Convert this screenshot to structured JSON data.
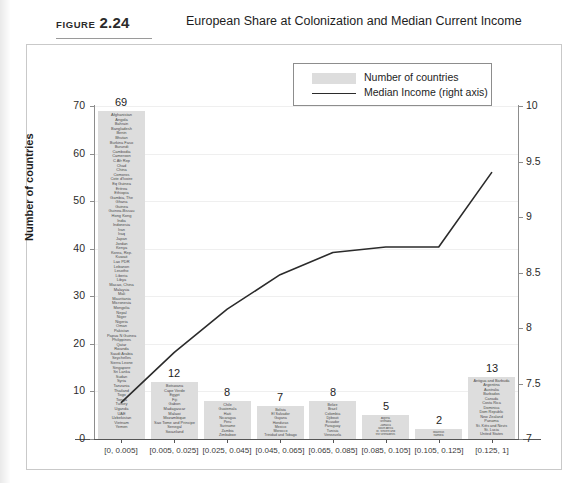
{
  "figure": {
    "label_word": "FIGURE",
    "label_number": "2.24",
    "title": "European Share at Colonization and Median Current Income"
  },
  "legend": {
    "items": [
      {
        "name": "bars",
        "label": "Number of countries",
        "marker": "grey-swatch",
        "color": "#dddddd"
      },
      {
        "name": "line",
        "label": "Median Income (right axis)",
        "marker": "black-line",
        "color": "#2b2b2b"
      }
    ]
  },
  "axes": {
    "left": {
      "title": "Number of countries",
      "ticks": [
        "0",
        "10",
        "20",
        "30",
        "40",
        "50",
        "60",
        "70"
      ],
      "min": 0,
      "max": 70
    },
    "right": {
      "title": "Median Current Income (in logs)",
      "ticks": [
        "7",
        "7.5",
        "8",
        "8.5",
        "9",
        "9.5",
        "10"
      ],
      "min": 7,
      "max": 10
    },
    "bottom": {
      "title": "",
      "ticks": [
        "[0, 0.005]",
        "[0.005, 0.025]",
        "[0.025, 0.045]",
        "[0.045, 0.065]",
        "[0.065, 0.085]",
        "[0.085, 0.105]",
        "[0.105, 0.125]",
        "[0.125, 1]"
      ]
    }
  },
  "chart_data": {
    "type": "bar",
    "title": "European Share at Colonization and Median Current Income",
    "xlabel": "",
    "ylabel": "Number of countries",
    "ylabel_secondary": "Median Current Income (in logs)",
    "ylim": [
      0,
      70
    ],
    "ylim_secondary": [
      7,
      10
    ],
    "grid": true,
    "legend_position": "top-center",
    "categories": [
      "[0, 0.005]",
      "[0.005, 0.025]",
      "[0.025, 0.045]",
      "[0.045, 0.065]",
      "[0.065, 0.085]",
      "[0.085, 0.105]",
      "[0.105, 0.125]",
      "[0.125, 1]"
    ],
    "series": [
      {
        "name": "Number of countries",
        "type": "bar",
        "axis": "left",
        "values": [
          69,
          12,
          8,
          7,
          8,
          5,
          2,
          13
        ]
      },
      {
        "name": "Median Income (right axis)",
        "type": "line",
        "axis": "right",
        "values": [
          7.33,
          7.78,
          8.17,
          8.48,
          8.68,
          8.73,
          8.73,
          9.4
        ]
      }
    ],
    "bin_members": [
      [
        "Afghanistan",
        "Angola",
        "Bahrain",
        "Bangladesh",
        "Benin",
        "Bhutan",
        "Burkina Faso",
        "Burundi",
        "Cambodia",
        "Cameroon",
        "C Afr Rep",
        "Chad",
        "China",
        "Comoros",
        "Cote d'Ivoire",
        "Eq Guinea",
        "Eritrea",
        "Ethiopia",
        "Gambia, The",
        "Ghana",
        "Guinea",
        "Guinea-Bissau",
        "Hong Kong",
        "India",
        "Indonesia",
        "Iran",
        "Iraq",
        "Japan",
        "Jordan",
        "Kenya",
        "Korea, Rep.",
        "Kuwait",
        "Lao PDR",
        "Lebanon",
        "Lesotho",
        "Liberia",
        "Libya",
        "Macao, China",
        "Malaysia",
        "Mali",
        "Mauritania",
        "Micronesia",
        "Mongolia",
        "Nepal",
        "Niger",
        "Nigeria",
        "Oman",
        "Pakistan",
        "Papua N Guinea",
        "Philippines",
        "Qatar",
        "Rwanda",
        "Saudi Arabia",
        "Seychelles",
        "Sierra Leone",
        "Singapore",
        "Sri Lanka",
        "Sudan",
        "Syria",
        "Tanzania",
        "Thailand",
        "Togo",
        "Tonga",
        "Turkey",
        "Uganda",
        "UAE",
        "Uzbekistan",
        "Vietnam",
        "Yemen"
      ],
      [
        "Botswana",
        "Cape Verde",
        "Egypt",
        "Fiji",
        "Gabon",
        "Madagascar",
        "Malawi",
        "Mozambique",
        "Sao Tome and Principe",
        "Senegal",
        "Swaziland"
      ],
      [
        "Chile",
        "Guatemala",
        "Haiti",
        "Nicaragua",
        "Peru",
        "Suriname",
        "Zambia",
        "Zimbabwe"
      ],
      [
        "Bolivia",
        "El Salvador",
        "Guyana",
        "Honduras",
        "Mexico",
        "Morocco",
        "Trinidad and Tobago"
      ],
      [
        "Belize",
        "Brazil",
        "Colombia",
        "Djibouti",
        "Ecuador",
        "Paraguay",
        "Tunisia",
        "Venezuela"
      ],
      [
        "Algeria",
        "Grenada",
        "Jamaica",
        "South Africa",
        "St. Vincent and",
        "the Grenadines"
      ],
      [
        "Mauritius",
        "Namibia"
      ],
      [
        "Antigua and Barbuda",
        "Argentina",
        "Australia",
        "Barbados",
        "Canada",
        "Costa Rica",
        "Dominica",
        "Dom Republic",
        "New Zealand",
        "Panama",
        "St. Kitts and Nevis",
        "St. Lucia",
        "United States"
      ]
    ],
    "bar_labels": [
      "69",
      "12",
      "8",
      "7",
      "8",
      "5",
      "2",
      "13"
    ]
  },
  "colors": {
    "bar_fill": "#dddddd",
    "line": "#2b2b2b",
    "grid": "#efefef",
    "axis": "#8d8d8d",
    "frame": "#c9c9c9"
  }
}
